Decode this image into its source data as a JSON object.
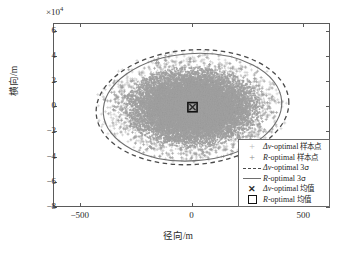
{
  "chart_data": {
    "type": "scatter",
    "title": "",
    "xlabel": "径向/m",
    "ylabel": "横向/m",
    "y_exponent_label": "×10",
    "y_exponent_power": "4",
    "xlim": [
      -620,
      620
    ],
    "ylim": [
      -8,
      6.6
    ],
    "y_scale_multiplier": 10000,
    "xticks": [
      -500,
      0,
      500
    ],
    "xticklabels": [
      "−500",
      "0",
      "500"
    ],
    "yticks": [
      6,
      4,
      2,
      0,
      -2,
      -4,
      -6,
      -8
    ],
    "yticklabels": [
      "6",
      "4",
      "2",
      "0",
      "−2",
      "−4",
      "−6",
      "−8"
    ],
    "grid": false,
    "legend_position": "lower right",
    "series": [
      {
        "name": "Δv-optimal 样本点",
        "marker": "plus",
        "color": "#c9c9c9",
        "kind": "scatter_cloud",
        "center": [
          0,
          0
        ],
        "sigma_x": 143,
        "sigma_y": 15000,
        "tilt_deg": -4,
        "n_points": 6000
      },
      {
        "name": "R-optimal 样本点",
        "marker": "plus",
        "color": "#9a9a9a",
        "kind": "scatter_cloud",
        "center": [
          0,
          0
        ],
        "sigma_x": 136,
        "sigma_y": 14200,
        "tilt_deg": -4,
        "n_points": 6000
      },
      {
        "name": "Δv-optimal 3σ",
        "marker": "dashed_ellipse",
        "color": "#4a4a4a",
        "kind": "ellipse",
        "center": [
          0,
          0
        ],
        "semi_x": 432,
        "semi_y": 45500,
        "tilt_deg": -4
      },
      {
        "name": "R-optimal 3σ",
        "marker": "solid_ellipse",
        "color": "#6e6e6e",
        "kind": "ellipse",
        "center": [
          0,
          0
        ],
        "semi_x": 400,
        "semi_y": 42500,
        "tilt_deg": -4
      },
      {
        "name": "Δv-optimal 均值",
        "marker": "x",
        "color": "#2b2b2b",
        "kind": "point",
        "point": [
          0,
          0
        ]
      },
      {
        "name": "R-optimal 均值",
        "marker": "square",
        "color": "#111111",
        "kind": "point",
        "point": [
          0,
          0
        ]
      }
    ]
  },
  "legend": {
    "entries": [
      {
        "prefix": "Δv",
        "mid": "-optimal ",
        "cn": "样本点",
        "key": "plus-faint-icon"
      },
      {
        "prefix": "R",
        "mid": "-optimal ",
        "cn": "样本点",
        "key": "plus-icon"
      },
      {
        "prefix": "Δv",
        "mid": "-optimal 3",
        "cn": "σ",
        "key": "dashed-line-icon"
      },
      {
        "prefix": "R",
        "mid": "-optimal 3",
        "cn": "σ",
        "key": "solid-line-icon"
      },
      {
        "prefix": "Δv",
        "mid": "-optimal ",
        "cn": "均值",
        "key": "x-marker-icon"
      },
      {
        "prefix": "R",
        "mid": "-optimal ",
        "cn": "均值",
        "key": "square-marker-icon"
      }
    ]
  }
}
